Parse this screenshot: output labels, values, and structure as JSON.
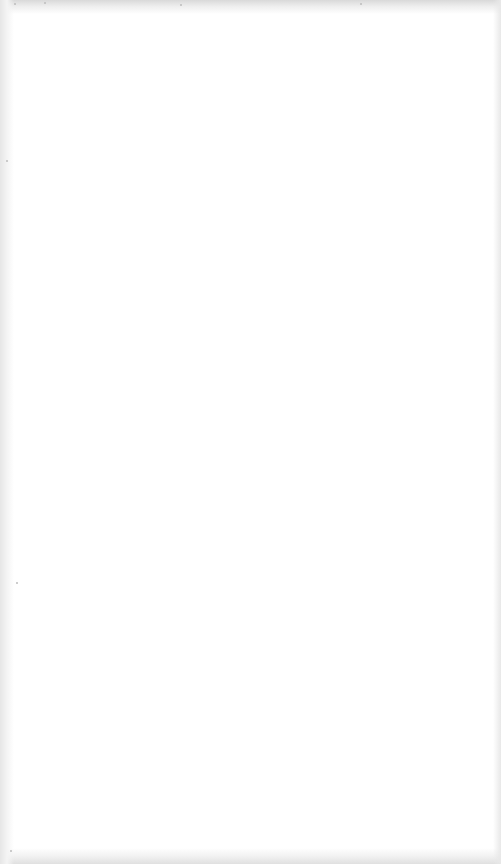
{
  "document": {
    "type": "blank scanned page",
    "background_color": "#ffffff",
    "edge_noise_color": "#d9d9d9",
    "visible_text": ""
  }
}
